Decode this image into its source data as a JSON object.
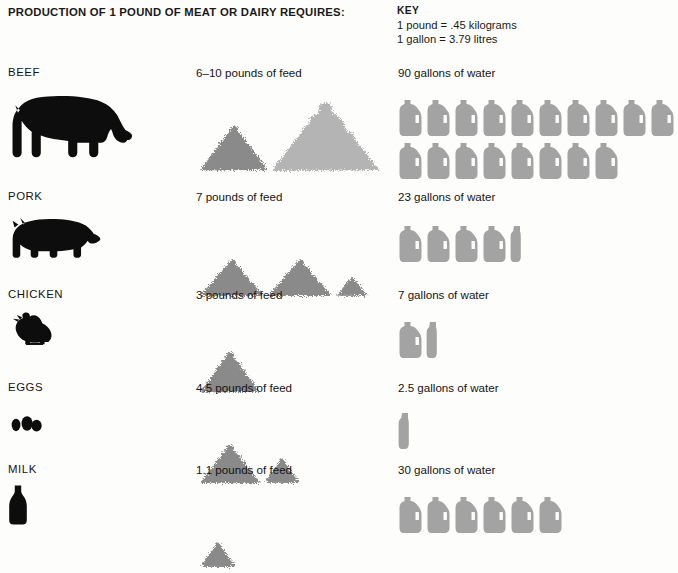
{
  "title": "PRODUCTION OF 1 POUND OF MEAT OR DAIRY REQUIRES:",
  "key": {
    "heading": "KEY",
    "line1": "1 pound = .45 kilograms",
    "line2": "1 gallon = 3.79 litres"
  },
  "colors": {
    "silhouette": "#0d0d0d",
    "jug": "#a3a3a3",
    "jug_label": "#fdfdfb",
    "feed_dark": "#8a8a8a",
    "feed_light": "#b4b4b4",
    "text": "#141414",
    "background": "#fdfdfb"
  },
  "units": {
    "gallons_per_full_jug": 5,
    "jug_full_icon": "water-jug-full",
    "jug_partial_icon": "water-jug-partial"
  },
  "rows": [
    {
      "label": "BEEF",
      "icon": "cow-silhouette",
      "feed_label": "6–10 pounds of feed",
      "feed_value_min": 6,
      "feed_value_max": 10,
      "feed_unit": "pounds",
      "feed_piles": [
        {
          "width": 66,
          "height": 44,
          "shade": "dark"
        },
        {
          "width": 105,
          "height": 68,
          "shade": "light"
        }
      ],
      "water_label": "90 gallons of water",
      "water_value": 90,
      "water_unit": "gallons",
      "jugs_full": 18,
      "jugs_partial": 0,
      "jug_rows": [
        10,
        8
      ]
    },
    {
      "label": "PORK",
      "icon": "pig-silhouette",
      "feed_label": "7 pounds of feed",
      "feed_value_min": 7,
      "feed_value_max": 7,
      "feed_unit": "pounds",
      "feed_piles": [
        {
          "width": 62,
          "height": 36,
          "shade": "dark"
        },
        {
          "width": 62,
          "height": 36,
          "shade": "dark"
        },
        {
          "width": 30,
          "height": 18,
          "shade": "dark"
        }
      ],
      "water_label": "23 gallons of water",
      "water_value": 23,
      "water_unit": "gallons",
      "jugs_full": 4,
      "jugs_partial": 1,
      "jug_rows": [
        5
      ]
    },
    {
      "label": "CHICKEN",
      "icon": "chicken-silhouette",
      "feed_label": "3 pounds of feed",
      "feed_value_min": 3,
      "feed_value_max": 3,
      "feed_unit": "pounds",
      "feed_piles": [
        {
          "width": 58,
          "height": 40,
          "shade": "dark"
        }
      ],
      "water_label": "7 gallons of water",
      "water_value": 7,
      "water_unit": "gallons",
      "jugs_full": 1,
      "jugs_partial": 1,
      "jug_rows": [
        2
      ]
    },
    {
      "label": "EGGS",
      "icon": "eggs-silhouette",
      "feed_label": "4.5 pounds of feed",
      "feed_value_min": 4.5,
      "feed_value_max": 4.5,
      "feed_unit": "pounds",
      "feed_piles": [
        {
          "width": 58,
          "height": 38,
          "shade": "dark"
        },
        {
          "width": 34,
          "height": 24,
          "shade": "dark"
        }
      ],
      "water_label": "2.5 gallons of water",
      "water_value": 2.5,
      "water_unit": "gallons",
      "jugs_full": 0,
      "jugs_partial": 1,
      "jug_rows": [
        1
      ]
    },
    {
      "label": "MILK",
      "icon": "milk-bottle-silhouette",
      "feed_label": "1.1 pounds of feed",
      "feed_value_min": 1.1,
      "feed_value_max": 1.1,
      "feed_unit": "pounds",
      "feed_piles": [
        {
          "width": 34,
          "height": 24,
          "shade": "dark"
        }
      ],
      "water_label": "30 gallons of water",
      "water_value": 30,
      "water_unit": "gallons",
      "jugs_full": 6,
      "jugs_partial": 0,
      "jug_rows": [
        6
      ]
    }
  ],
  "chart_data": {
    "type": "table",
    "title": "PRODUCTION OF 1 POUND OF MEAT OR DAIRY REQUIRES:",
    "columns": [
      "Product",
      "Feed (pounds)",
      "Water (gallons)"
    ],
    "rows": [
      [
        "BEEF",
        "6–10",
        90
      ],
      [
        "PORK",
        "7",
        23
      ],
      [
        "CHICKEN",
        "3",
        7
      ],
      [
        "EGGS",
        "4.5",
        2.5
      ],
      [
        "MILK",
        "1.1",
        30
      ]
    ],
    "categories": [
      "BEEF",
      "PORK",
      "CHICKEN",
      "EGGS",
      "MILK"
    ],
    "series": [
      {
        "name": "Feed (pounds of feed)",
        "values": [
          10,
          7,
          3,
          4.5,
          1.1
        ]
      },
      {
        "name": "Water (gallons of water)",
        "values": [
          90,
          23,
          7,
          2.5,
          30
        ]
      }
    ],
    "annotations": [
      "1 pound = .45 kilograms",
      "1 gallon = 3.79 litres"
    ],
    "legend_position": "top-right",
    "grid": false
  }
}
